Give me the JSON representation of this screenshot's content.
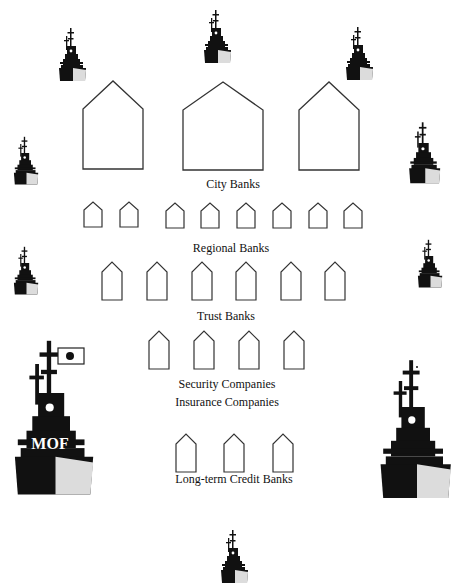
{
  "diagram": {
    "title": "",
    "colors": {
      "ship": "#111111",
      "stroke": "#333333",
      "flag_sun": "#111111",
      "hull_light": "#d8d8d8"
    },
    "tiers": [
      {
        "label": "City Banks",
        "count": 3
      },
      {
        "label": "Regional Banks",
        "count": 8
      },
      {
        "label": "Trust Banks",
        "count": 6
      },
      {
        "label": "Security Companies",
        "count": 4
      },
      {
        "label": "Insurance Companies",
        "count": 0
      },
      {
        "label": "Long-term Credit Banks",
        "count": 3
      }
    ],
    "flagship": {
      "label": "MOF",
      "flag": "japan-flag"
    },
    "escort_ships": 10
  }
}
